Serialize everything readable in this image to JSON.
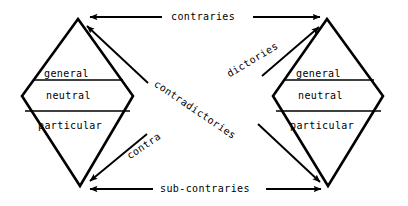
{
  "diagram": {
    "ink_color": "#000000",
    "background_color": "#ffffff",
    "left_figure": {
      "name": "left-diamond",
      "rows": [
        {
          "label": "general"
        },
        {
          "label": "neutral"
        },
        {
          "label": "particular"
        }
      ]
    },
    "right_figure": {
      "name": "right-diamond",
      "rows": [
        {
          "label": "general"
        },
        {
          "label": "neutral"
        },
        {
          "label": "particular"
        }
      ]
    },
    "relations": {
      "top": "contraries",
      "bottom": "sub-contraries",
      "diagonal_main": "contradictories",
      "diagonal_left_fragment": "contra",
      "diagonal_right_fragment": "dictories"
    }
  }
}
